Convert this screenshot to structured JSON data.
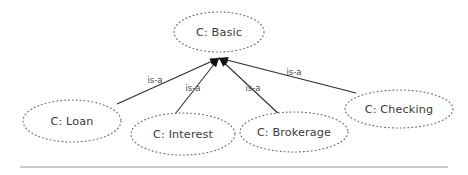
{
  "diagram": {
    "type": "class-hierarchy",
    "title": "",
    "background_color": "#ffffff",
    "node_outline_color": "#6e6e6e",
    "node_outline_style": "dotted",
    "edge_color": "#2b2b2b",
    "text_color": "#3a3a3a",
    "rule_color": "#9a9a9a",
    "root": {
      "id": "basic",
      "label": "C: Basic",
      "cx": 219,
      "cy": 32,
      "rx": 45,
      "ry": 20
    },
    "children": [
      {
        "id": "loan",
        "label": "C: Loan",
        "cx": 72,
        "cy": 121,
        "rx": 49,
        "ry": 21,
        "edge_label": "is-a",
        "edge_label_x": 155,
        "edge_label_y": 80,
        "attach_x": 117,
        "attach_y": 104
      },
      {
        "id": "interest",
        "label": "C: Interest",
        "cx": 183,
        "cy": 134,
        "rx": 52,
        "ry": 21,
        "edge_label": "is-a",
        "edge_label_x": 193,
        "edge_label_y": 88,
        "attach_x": 172,
        "attach_y": 118
      },
      {
        "id": "brokerage",
        "label": "C: Brokerage",
        "cx": 294,
        "cy": 132,
        "rx": 54,
        "ry": 20,
        "edge_label": "is-a",
        "edge_label_x": 253,
        "edge_label_y": 88,
        "attach_x": 281,
        "attach_y": 116
      },
      {
        "id": "checking",
        "label": "C: Checking",
        "cx": 399,
        "cy": 109,
        "rx": 54,
        "ry": 19,
        "edge_label": "is-a",
        "edge_label_x": 294,
        "edge_label_y": 72,
        "attach_x": 356,
        "attach_y": 93
      }
    ],
    "junction": {
      "x": 219,
      "y": 58
    },
    "footer_rule": {
      "x1": 20,
      "x2": 448,
      "y": 167
    }
  }
}
